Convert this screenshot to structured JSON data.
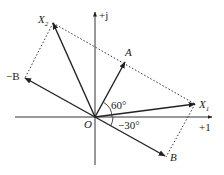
{
  "diagram": {
    "type": "phasor-diagram",
    "axes": {
      "real_label": "+1",
      "imag_label": "+j",
      "origin_label": "O"
    },
    "phasors": [
      {
        "name": "A",
        "label": "A",
        "angle_deg": 60
      },
      {
        "name": "B",
        "label": "B",
        "angle_deg": -30
      },
      {
        "name": "-B",
        "label": "−B",
        "angle_deg": 150
      },
      {
        "name": "X1",
        "label": "X",
        "subscript": "1"
      },
      {
        "name": "X2",
        "label": "X",
        "subscript": "2"
      }
    ],
    "angle_labels": {
      "a_angle": "60°",
      "b_angle": "−30°"
    }
  },
  "colors": {
    "line": "#222222",
    "axis": "#333333",
    "dotted": "#333333"
  }
}
